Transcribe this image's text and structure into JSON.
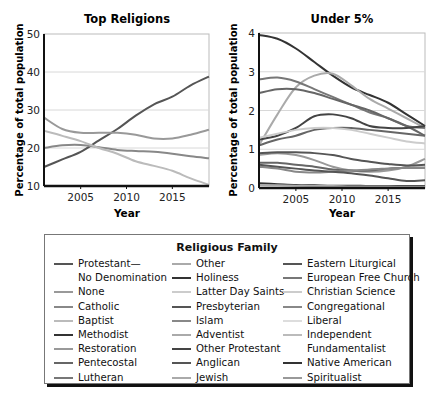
{
  "chart_data": [
    {
      "type": "line",
      "title": "Top Religions",
      "xlabel": "Year",
      "ylabel": "Percentage of total population",
      "xlim": [
        2001,
        2019
      ],
      "ylim": [
        10,
        50
      ],
      "yticks": [
        10,
        20,
        30,
        40,
        50
      ],
      "xticks": [
        2005,
        2010,
        2015
      ],
      "grid": "horizontal",
      "x": [
        2001,
        2003,
        2005,
        2007,
        2009,
        2011,
        2013,
        2015,
        2017,
        2019
      ],
      "series": [
        {
          "name": "Protestant—No Denomination",
          "color": "#555555",
          "values": [
            15,
            17,
            19,
            22,
            25,
            28.5,
            31.5,
            33.5,
            36.5,
            38.8
          ]
        },
        {
          "name": "None",
          "color": "#999999",
          "values": [
            28,
            25,
            24,
            24,
            24,
            23.5,
            22.5,
            22.5,
            23.5,
            24.8
          ]
        },
        {
          "name": "Catholic",
          "color": "#888888",
          "values": [
            20,
            20.7,
            20.8,
            20.2,
            19.5,
            19.2,
            19.0,
            18.5,
            17.8,
            17.3
          ]
        },
        {
          "name": "Baptist",
          "color": "#bbbbbb",
          "values": [
            24.5,
            23.2,
            21.8,
            20.0,
            18.5,
            16.5,
            15.3,
            14.0,
            12.0,
            10.3
          ]
        }
      ]
    },
    {
      "type": "line",
      "title": "Under 5%",
      "xlabel": "Year",
      "ylabel": "Percentage of total population",
      "xlim": [
        2001,
        2019
      ],
      "ylim": [
        0,
        4
      ],
      "yticks": [
        0,
        1,
        2,
        3,
        4
      ],
      "xticks": [
        2005,
        2010,
        2015
      ],
      "grid": "horizontal",
      "x": [
        2001,
        2003,
        2005,
        2007,
        2009,
        2011,
        2013,
        2015,
        2017,
        2019
      ],
      "series": [
        {
          "name": "Methodist",
          "color": "#333333",
          "values": [
            3.95,
            3.85,
            3.6,
            3.25,
            2.9,
            2.6,
            2.4,
            2.2,
            1.9,
            1.6
          ]
        },
        {
          "name": "Other",
          "color": "#aaaaaa",
          "values": [
            1.1,
            1.9,
            2.6,
            2.9,
            2.95,
            2.65,
            2.3,
            2.05,
            1.8,
            1.55
          ]
        },
        {
          "name": "Lutheran",
          "color": "#777777",
          "values": [
            2.8,
            2.85,
            2.75,
            2.55,
            2.35,
            2.15,
            1.95,
            1.8,
            1.6,
            1.55
          ]
        },
        {
          "name": "Pentecostal",
          "color": "#666666",
          "values": [
            2.45,
            2.55,
            2.55,
            2.45,
            2.3,
            2.15,
            2.0,
            1.8,
            1.6,
            1.35
          ]
        },
        {
          "name": "Holiness",
          "color": "#444444",
          "values": [
            1.25,
            1.35,
            1.55,
            1.85,
            1.9,
            1.8,
            1.6,
            1.55,
            1.55,
            1.6
          ]
        },
        {
          "name": "Presbyterian",
          "color": "#666666",
          "values": [
            1.1,
            1.25,
            1.35,
            1.5,
            1.55,
            1.55,
            1.5,
            1.45,
            1.4,
            1.35
          ]
        },
        {
          "name": "Latter Day Saints",
          "color": "#cccccc",
          "values": [
            1.3,
            1.4,
            1.5,
            1.55,
            1.55,
            1.5,
            1.4,
            1.3,
            1.2,
            1.15
          ]
        },
        {
          "name": "Restoration",
          "color": "#999999",
          "values": [
            0.85,
            0.9,
            0.85,
            0.72,
            0.55,
            0.45,
            0.42,
            0.45,
            0.55,
            0.75
          ]
        },
        {
          "name": "Other Protestant",
          "color": "#555555",
          "values": [
            0.9,
            0.92,
            0.92,
            0.9,
            0.85,
            0.75,
            0.68,
            0.62,
            0.58,
            0.6
          ]
        },
        {
          "name": "Anglican",
          "color": "#666666",
          "values": [
            0.65,
            0.65,
            0.6,
            0.55,
            0.48,
            0.45,
            0.45,
            0.5,
            0.52,
            0.52
          ]
        },
        {
          "name": "Islam",
          "color": "#888888",
          "values": [
            0.55,
            0.5,
            0.42,
            0.4,
            0.42,
            0.45,
            0.48,
            0.5,
            0.52,
            0.52
          ]
        },
        {
          "name": "Eastern Liturgical",
          "color": "#555555",
          "values": [
            0.6,
            0.55,
            0.5,
            0.45,
            0.42,
            0.38,
            0.32,
            0.25,
            0.18,
            0.2
          ]
        },
        {
          "name": "Native American",
          "color": "#333333",
          "values": [
            0.12,
            0.1,
            0.08,
            0.07,
            0.06,
            0.06,
            0.05,
            0.05,
            0.05,
            0.05
          ]
        },
        {
          "name": "Jewish",
          "color": "#aaaaaa",
          "values": [
            0.08,
            0.07,
            0.06,
            0.05,
            0.05,
            0.04,
            0.04,
            0.04,
            0.03,
            0.03
          ]
        }
      ]
    }
  ],
  "legend": {
    "title": "Religious Family",
    "columns": [
      [
        {
          "label": "Protestant—",
          "color": "#555555"
        },
        {
          "label": "No Denomination",
          "color": null
        },
        {
          "label": "None",
          "color": "#999999"
        },
        {
          "label": "Catholic",
          "color": "#888888"
        },
        {
          "label": "Baptist",
          "color": "#bbbbbb"
        },
        {
          "label": "Methodist",
          "color": "#333333"
        },
        {
          "label": "Restoration",
          "color": "#999999"
        },
        {
          "label": "Pentecostal",
          "color": "#666666"
        },
        {
          "label": "Lutheran",
          "color": "#777777"
        }
      ],
      [
        {
          "label": "Other",
          "color": "#aaaaaa"
        },
        {
          "label": "Holiness",
          "color": "#333333"
        },
        {
          "label": "Latter Day Saints",
          "color": "#cccccc"
        },
        {
          "label": "Presbyterian",
          "color": "#555555"
        },
        {
          "label": "Islam",
          "color": "#888888"
        },
        {
          "label": "Adventist",
          "color": "#aaaaaa"
        },
        {
          "label": "Other Protestant",
          "color": "#444444"
        },
        {
          "label": "Anglican",
          "color": "#555555"
        },
        {
          "label": "Jewish",
          "color": "#aaaaaa"
        }
      ],
      [
        {
          "label": "Eastern Liturgical",
          "color": "#555555"
        },
        {
          "label": "European Free Church",
          "color": "#777777"
        },
        {
          "label": "Christian Science",
          "color": "#cccccc"
        },
        {
          "label": "Congregational",
          "color": "#888888"
        },
        {
          "label": "Liberal",
          "color": "#dddddd"
        },
        {
          "label": "Independent",
          "color": "#bbbbbb"
        },
        {
          "label": "Fundamentalist",
          "color": null
        },
        {
          "label": "Native American",
          "color": "#333333"
        },
        {
          "label": "Spiritualist",
          "color": "#999999"
        }
      ]
    ]
  }
}
